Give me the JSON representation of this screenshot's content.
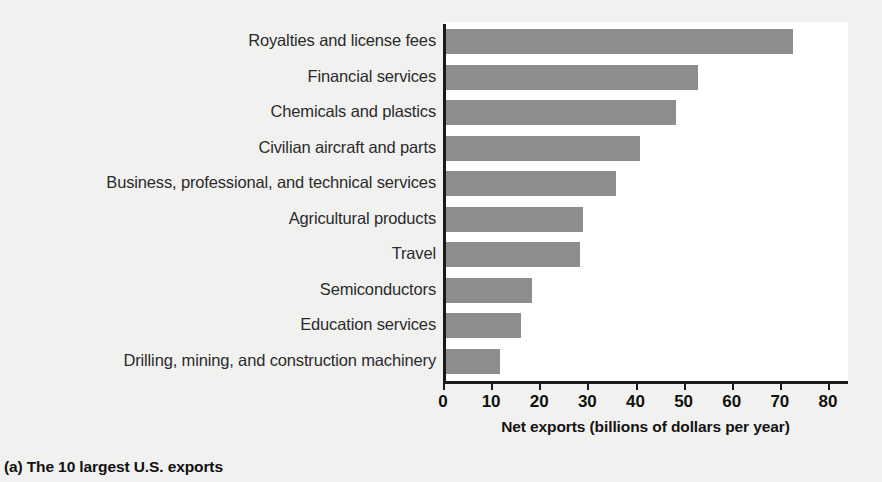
{
  "chart_data": {
    "type": "bar",
    "orientation": "horizontal",
    "title": "",
    "subtitle": "",
    "xlabel": "Net exports (billions of dollars per year)",
    "ylabel": "",
    "xlim": [
      0,
      80
    ],
    "xticks": [
      0,
      10,
      20,
      30,
      40,
      50,
      60,
      70,
      80
    ],
    "xtick_labels": [
      "0",
      "10",
      "20",
      "30",
      "40",
      "50",
      "60",
      "70",
      "80"
    ],
    "grid": false,
    "legend": null,
    "legend_position": "none",
    "bar_color": "#8d8d8d",
    "axis_color": "#1a1a1a",
    "plot_background": "#ffffff",
    "figure_background": "#f1f1f0",
    "categories": [
      "Royalties and license fees",
      "Financial services",
      "Chemicals and plastics",
      "Civilian aircraft and parts",
      "Business, professional, and technical services",
      "Agricultural products",
      "Travel",
      "Semiconductors",
      "Education services",
      "Drilling, mining, and construction machinery"
    ],
    "values": [
      72.7,
      53.0,
      48.5,
      41.0,
      36.0,
      29.0,
      28.5,
      18.5,
      16.3,
      11.8
    ],
    "units": "billions of dollars per year"
  },
  "caption": {
    "letter": "(a)",
    "text": "The 10 largest U.S. exports"
  }
}
